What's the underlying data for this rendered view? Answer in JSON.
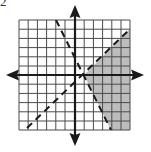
{
  "figure": {
    "problem_label": "2",
    "type": "graph of system of linear inequalities",
    "grid": {
      "x_range": [
        -6,
        6
      ],
      "y_range": [
        -6,
        6
      ],
      "cell_px": 9.2,
      "origin_px": [
        75,
        75
      ],
      "left_px": 19,
      "top_px": 20,
      "right_px": 130,
      "bottom_px": 130
    },
    "lines": [
      {
        "name": "boundary-negative-slope",
        "equation": "y = -2x + 2",
        "slope": -2,
        "intercept": 2,
        "style": "dashed"
      },
      {
        "name": "boundary-positive-slope",
        "equation": "y = x - 1",
        "slope": 1,
        "intercept": -1,
        "style": "dashed"
      }
    ],
    "shaded_region": {
      "description": "y > -2x + 2 and y < x - 1",
      "color": "#bdbdbd"
    },
    "intersection_point": [
      1,
      0
    ],
    "colors": {
      "grid": "#4a4a4a",
      "axis": "#1a1a1a",
      "dashed_line": "#1a1a1a",
      "shade": "#bdbdbd",
      "background": "#ffffff"
    }
  }
}
